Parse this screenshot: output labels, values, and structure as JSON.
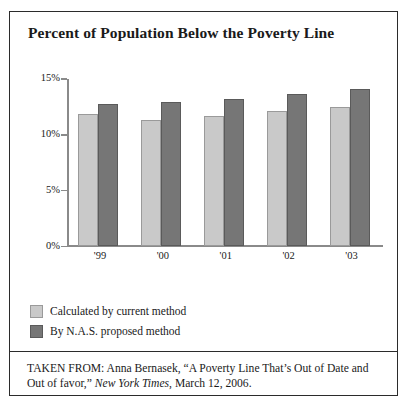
{
  "figure": {
    "title": "Percent of Population Below the Poverty Line",
    "source_prefix": "TAKEN FROM: Anna Bernasek, “A Poverty Line That’s Out of Date and Out of favor,” ",
    "source_publication": "New York Times",
    "source_suffix": ", March 12, 2006."
  },
  "colors": {
    "series_light": "#c9c9c9",
    "series_dark": "#767676",
    "axis": "#8a8a8a",
    "border": "#2b2b2b",
    "text": "#1a1a1a"
  },
  "chart_data": {
    "type": "bar",
    "title": "Percent of Population Below the Poverty Line",
    "xlabel": "",
    "ylabel": "",
    "categories": [
      "'99",
      "'00",
      "'01",
      "'02",
      "'03"
    ],
    "series": [
      {
        "name": "Calculated by current method",
        "color": "#c9c9c9",
        "values": [
          11.9,
          11.3,
          11.7,
          12.1,
          12.5
        ]
      },
      {
        "name": "By N.A.S. proposed method",
        "color": "#767676",
        "values": [
          12.8,
          12.9,
          13.2,
          13.7,
          14.1
        ]
      }
    ],
    "ylim": [
      0,
      15
    ],
    "ytick_values": [
      15,
      10,
      5,
      0
    ],
    "ytick_labels": [
      "15%",
      "10%",
      "5%",
      "0%"
    ],
    "grid": false,
    "legend_position": "below-plot-left"
  }
}
